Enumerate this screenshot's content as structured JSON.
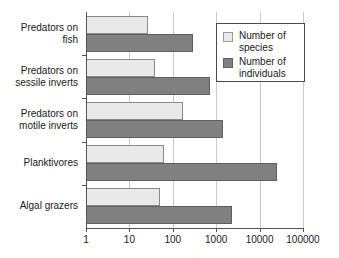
{
  "chart_data": {
    "type": "bar",
    "orientation": "horizontal",
    "title": "",
    "xlabel": "",
    "ylabel": "",
    "xscale": "log",
    "xlim": [
      1,
      100000
    ],
    "xticks": [
      "1",
      "10",
      "100",
      "1000",
      "10000",
      "100000"
    ],
    "grid": true,
    "legend_position": "top-right",
    "categories": [
      "Predators on\nfish",
      "Predators on\nsessile inverts",
      "Predators on\nmotile inverts",
      "Planktivores",
      "Algal grazers"
    ],
    "series": [
      {
        "name": "Number of\nspecies",
        "color": "#e9e9e9",
        "values": [
          27,
          39,
          170,
          63,
          51
        ]
      },
      {
        "name": "Number of\nindividuals",
        "color": "#808080",
        "values": [
          290,
          720,
          1400,
          25000,
          2300
        ]
      }
    ]
  },
  "legend": {
    "items": [
      {
        "label": "Number of\nspecies"
      },
      {
        "label": "Number of\nindividuals"
      }
    ]
  }
}
